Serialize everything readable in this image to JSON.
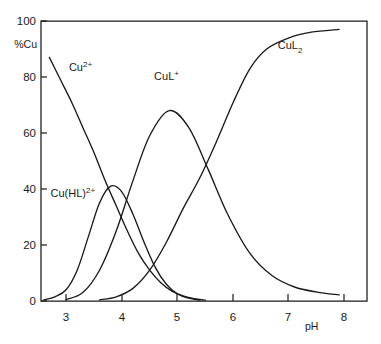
{
  "chart_data": {
    "type": "line",
    "title": "",
    "xlabel": "pH",
    "ylabel": "%Cu",
    "xlim": [
      2.55,
      8.4
    ],
    "ylim": [
      0,
      100
    ],
    "grid": false,
    "legend_position": "inline-annotations",
    "xticks": [
      "3",
      "4",
      "5",
      "6",
      "7",
      "8"
    ],
    "xtick_values": [
      3,
      4,
      5,
      6,
      7,
      8
    ],
    "yticks": [
      "0",
      "20",
      "40",
      "60",
      "80",
      "100"
    ],
    "ytick_values": [
      0,
      20,
      40,
      60,
      80,
      100
    ],
    "series": [
      {
        "name": "Cu2+",
        "label_base": "Cu",
        "label_sup": "2+",
        "label_sub": "",
        "x": [
          2.7,
          2.9,
          3.1,
          3.3,
          3.5,
          3.7,
          3.9,
          4.1,
          4.3,
          4.5,
          4.7,
          4.9,
          5.1,
          5.3,
          5.5
        ],
        "values": [
          87,
          79,
          71,
          62,
          53,
          43,
          34,
          25,
          17,
          11,
          6.5,
          3.5,
          1.8,
          0.8,
          0.3
        ]
      },
      {
        "name": "Cu(HL)2+",
        "label_base": "Cu(HL)",
        "label_sup": "2+",
        "label_sub": "",
        "x": [
          2.6,
          2.8,
          3.0,
          3.2,
          3.4,
          3.6,
          3.8,
          4.0,
          4.2,
          4.4,
          4.6,
          4.8,
          5.0,
          5.2,
          5.4
        ],
        "values": [
          0.4,
          1.5,
          4.0,
          11,
          23,
          35,
          41,
          39,
          31,
          21,
          12,
          6.0,
          2.5,
          1.0,
          0.3
        ]
      },
      {
        "name": "CuL+",
        "label_base": "CuL",
        "label_sup": "+",
        "label_sub": "",
        "x": [
          3.0,
          3.3,
          3.6,
          3.9,
          4.2,
          4.5,
          4.85,
          5.2,
          5.55,
          5.9,
          6.3,
          6.7,
          7.1,
          7.5,
          7.9
        ],
        "values": [
          0.5,
          3.0,
          11,
          25,
          43,
          59,
          68,
          62,
          47,
          31,
          17,
          9.0,
          5.0,
          3.2,
          2.2
        ]
      },
      {
        "name": "CuL2",
        "label_base": "CuL",
        "label_sup": "",
        "label_sub": "2",
        "x": [
          3.6,
          3.9,
          4.2,
          4.5,
          4.8,
          5.1,
          5.4,
          5.7,
          6.0,
          6.3,
          6.6,
          7.0,
          7.4,
          7.9
        ],
        "values": [
          0.4,
          1.5,
          4.5,
          11,
          21,
          33,
          44,
          57,
          71,
          83,
          90,
          94,
          96,
          97
        ]
      }
    ],
    "annotations": [
      {
        "text": "Cu2+",
        "x": 3.05,
        "y": 82
      },
      {
        "text": "Cu(HL)2+",
        "x": 2.72,
        "y": 37
      },
      {
        "text": "CuL+",
        "x": 4.58,
        "y": 79
      },
      {
        "text": "CuL2",
        "x": 6.8,
        "y": 90
      }
    ]
  }
}
